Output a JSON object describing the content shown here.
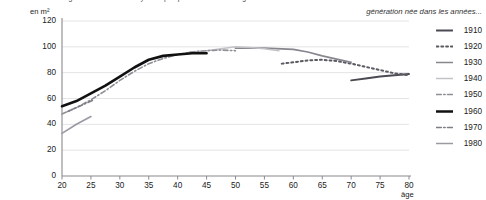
{
  "clipped_header": "logement : surface moyenne par personne selon l'âge",
  "axes": {
    "y_unit_label": "en m²",
    "x_axis_label": "âge",
    "y_ticks": [
      0,
      20,
      40,
      60,
      80,
      100,
      120
    ],
    "x_ticks": [
      20,
      25,
      30,
      35,
      40,
      45,
      50,
      55,
      60,
      65,
      70,
      75,
      80
    ]
  },
  "legend": {
    "title": "génération née dans les années...",
    "items": [
      {
        "label": "1910",
        "style": "solid",
        "color": "#4a4a52",
        "width": 1.9
      },
      {
        "label": "1920",
        "style": "dotted",
        "color": "#5a5a62",
        "width": 2.0
      },
      {
        "label": "1930",
        "style": "solid",
        "color": "#86868e",
        "width": 1.7
      },
      {
        "label": "1940",
        "style": "solid",
        "color": "#c2c2c8",
        "width": 1.6
      },
      {
        "label": "1950",
        "style": "dashdot",
        "color": "#8e8e96",
        "width": 1.6
      },
      {
        "label": "1960",
        "style": "solid",
        "color": "#111111",
        "width": 2.6
      },
      {
        "label": "1970",
        "style": "dashdot",
        "color": "#7e7e86",
        "width": 1.6
      },
      {
        "label": "1980",
        "style": "solid",
        "color": "#9a9aa2",
        "width": 1.7
      }
    ]
  },
  "chart_data": {
    "type": "line",
    "title": "logement : surface moyenne par personne selon l'âge",
    "xlabel": "âge",
    "ylabel": "en m²",
    "xlim": [
      20,
      80
    ],
    "ylim": [
      0,
      120
    ],
    "xticks": [
      20,
      25,
      30,
      35,
      40,
      45,
      50,
      55,
      60,
      65,
      70,
      75,
      80
    ],
    "yticks": [
      0,
      20,
      40,
      60,
      80,
      100,
      120
    ],
    "grid": "horizontal",
    "legend_position": "right",
    "legend_title": "génération née dans les années...",
    "series": [
      {
        "name": "1910",
        "style": "solid",
        "color": "#4a4a52",
        "x": [
          70,
          72.5,
          75,
          77.5,
          80
        ],
        "y": [
          74,
          75.5,
          77,
          78,
          79
        ]
      },
      {
        "name": "1920",
        "style": "dotted",
        "color": "#5a5a62",
        "x": [
          58,
          60,
          62.5,
          65,
          67.5,
          70,
          72.5,
          75,
          77.5,
          80
        ],
        "y": [
          87,
          88,
          89.5,
          90,
          89,
          87,
          84.5,
          82,
          79.5,
          78
        ]
      },
      {
        "name": "1930",
        "style": "solid",
        "color": "#86868e",
        "x": [
          50,
          55,
          60,
          62.5,
          65,
          70
        ],
        "y": [
          99,
          99,
          98,
          96,
          93,
          88
        ]
      },
      {
        "name": "1940",
        "style": "solid",
        "color": "#c2c2c8",
        "x": [
          42,
          45,
          47.5,
          50,
          52.5,
          55,
          57.5
        ],
        "y": [
          96,
          97,
          98.5,
          100,
          99.5,
          98.5,
          97
        ]
      },
      {
        "name": "1950",
        "style": "dashdot",
        "color": "#8e8e96",
        "x": [
          20,
          22.5,
          25,
          27.5,
          30,
          32.5,
          35,
          37.5,
          40,
          42.5,
          45,
          47.5,
          50
        ],
        "y": [
          48,
          53,
          59,
          66,
          74,
          81,
          87,
          91,
          94,
          96,
          97,
          97.5,
          97
        ]
      },
      {
        "name": "1960",
        "style": "solid",
        "color": "#111111",
        "x": [
          20,
          22.5,
          25,
          27.5,
          30,
          32.5,
          35,
          37.5,
          40,
          42.5,
          45
        ],
        "y": [
          54,
          58,
          64,
          70,
          77,
          84,
          90,
          93,
          94,
          95,
          95
        ]
      },
      {
        "name": "1970",
        "style": "dashdot",
        "color": "#7e7e86",
        "x": [
          21,
          22.5,
          24,
          25.5
        ],
        "y": [
          50,
          53,
          56,
          59
        ]
      },
      {
        "name": "1980",
        "style": "solid",
        "color": "#9a9aa2",
        "x": [
          20,
          22.5,
          25
        ],
        "y": [
          33,
          40,
          46
        ]
      }
    ]
  },
  "colors": {
    "gridline": "#e4e4e7",
    "axis": "#8a8a90",
    "text": "#222222"
  }
}
